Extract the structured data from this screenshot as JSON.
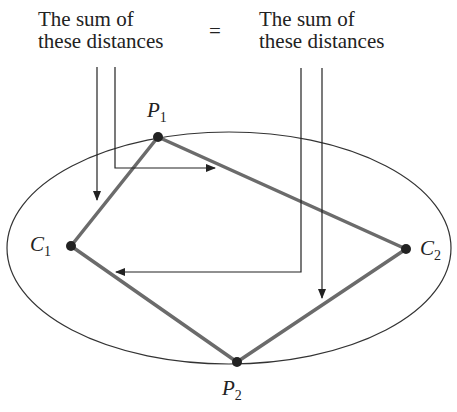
{
  "left_label": {
    "line1": "The sum of",
    "line2": "these distances"
  },
  "equals": "=",
  "right_label": {
    "line1": "The sum of",
    "line2": "these distances"
  },
  "points": {
    "P1": {
      "name": "P",
      "sub": "1"
    },
    "P2": {
      "name": "P",
      "sub": "2"
    },
    "C1": {
      "name": "C",
      "sub": "1"
    },
    "C2": {
      "name": "C",
      "sub": "2"
    }
  },
  "colors": {
    "segments": "#6b6b6b",
    "ellipse": "#333333",
    "arrows": "#222222"
  }
}
